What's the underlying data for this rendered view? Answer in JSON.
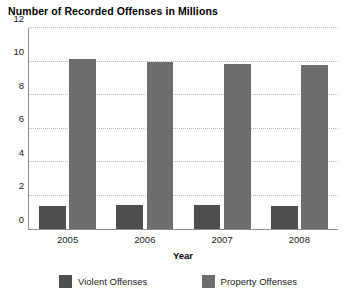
{
  "chart_data": {
    "type": "bar",
    "title": "Number of Recorded Offenses in Millions",
    "xlabel": "Year",
    "ylabel": "",
    "categories": [
      "2005",
      "2006",
      "2007",
      "2008"
    ],
    "series": [
      {
        "name": "Violent Offenses",
        "color": "#4e4e4e",
        "values": [
          1.39,
          1.42,
          1.41,
          1.39
        ]
      },
      {
        "name": "Property Offenses",
        "color": "#6d6d6d",
        "values": [
          10.17,
          9.98,
          9.84,
          9.77
        ]
      }
    ],
    "ylim": [
      0,
      12
    ],
    "yticks": [
      "0",
      "2",
      "4",
      "6",
      "8",
      "10",
      "12"
    ],
    "ytick_values": [
      0,
      2,
      4,
      6,
      8,
      10,
      12
    ],
    "grid": true,
    "grid_axis": "y",
    "legend_position": "bottom",
    "axis_color": "#8d8d8d",
    "grid_color": "#b9b9b9",
    "background": "#ffffff"
  }
}
